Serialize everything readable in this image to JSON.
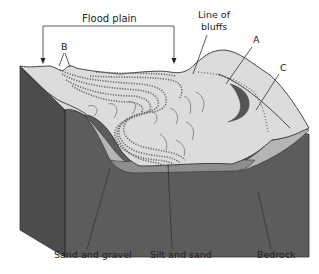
{
  "diagram": {
    "type": "block-diagram",
    "labels": {
      "flood_plain": "Flood plain",
      "line_of_bluffs_1": "Line of",
      "line_of_bluffs_2": "bluffs",
      "a": "A",
      "b": "B",
      "c": "C",
      "sand_and_gravel": "Sand and gravel",
      "silt_and_sand": "Silt and sand",
      "bedrock": "Bedrock"
    },
    "colors": {
      "surface": "#d9d9d9",
      "bedrock_front": "#5a5a5a",
      "bedrock_side": "#4a4a4a",
      "sand_gravel": "#b4b4b4",
      "silt_sand": "#8c8c8c",
      "oxbow": "#555555",
      "background": "#ffffff"
    }
  }
}
